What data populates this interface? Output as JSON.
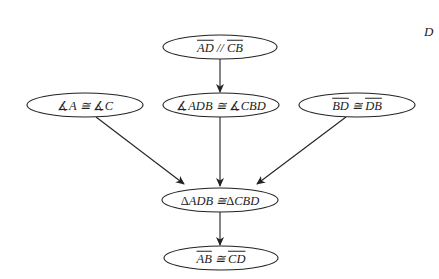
{
  "diagram": {
    "type": "proof-flowchart",
    "colors": {
      "stroke": "#222222",
      "background": "#ffffff",
      "text": "#222222"
    },
    "corner_label": "D",
    "nodes": [
      {
        "id": "given_parallel",
        "parts": [
          {
            "t": "AD",
            "overline": true
          },
          {
            "t": " // "
          },
          {
            "t": "CB",
            "overline": true
          }
        ],
        "text": "AD // CB",
        "cx": 220,
        "cy": 47,
        "rx": 57,
        "ry": 12
      },
      {
        "id": "angles_a_c",
        "parts": [
          {
            "t": "∡",
            "upright": true
          },
          {
            "t": "A ≅ "
          },
          {
            "t": "∡",
            "upright": true
          },
          {
            "t": "C"
          }
        ],
        "text": "∡A ≅ ∡C",
        "cx": 85,
        "cy": 105,
        "rx": 58,
        "ry": 12
      },
      {
        "id": "angles_adb_cbd",
        "parts": [
          {
            "t": "∡",
            "upright": true
          },
          {
            "t": "ADB ≅ "
          },
          {
            "t": "∡",
            "upright": true
          },
          {
            "t": "CBD"
          }
        ],
        "text": "∡ADB ≅ ∡CBD",
        "cx": 221,
        "cy": 105,
        "rx": 58,
        "ry": 12
      },
      {
        "id": "side_bd_db",
        "parts": [
          {
            "t": "BD",
            "overline": true
          },
          {
            "t": " ≅ "
          },
          {
            "t": "DB",
            "overline": true
          }
        ],
        "text": "BD ≅ DB",
        "cx": 357,
        "cy": 105,
        "rx": 58,
        "ry": 12
      },
      {
        "id": "triangles_congruent",
        "parts": [
          {
            "t": "Δ",
            "upright": true
          },
          {
            "t": "ADB ≅"
          },
          {
            "t": "Δ",
            "upright": true
          },
          {
            "t": "CBD"
          }
        ],
        "text": "ΔADB ≅ ΔCBD",
        "cx": 220,
        "cy": 200,
        "rx": 58,
        "ry": 12
      },
      {
        "id": "conclusion",
        "parts": [
          {
            "t": "AB",
            "overline": true
          },
          {
            "t": " ≅ "
          },
          {
            "t": "CD",
            "overline": true
          }
        ],
        "text": "AB ≅ CD",
        "cx": 221,
        "cy": 258,
        "rx": 57,
        "ry": 12
      }
    ],
    "edges": [
      {
        "from": "given_parallel",
        "to": "angles_adb_cbd",
        "x1": 220,
        "y1": 59,
        "x2": 220,
        "y2": 92
      },
      {
        "from": "angles_a_c",
        "to": "triangles_congruent",
        "x1": 96,
        "y1": 117,
        "x2": 184,
        "y2": 184
      },
      {
        "from": "angles_adb_cbd",
        "to": "triangles_congruent",
        "x1": 220,
        "y1": 117,
        "x2": 220,
        "y2": 186
      },
      {
        "from": "side_bd_db",
        "to": "triangles_congruent",
        "x1": 346,
        "y1": 117,
        "x2": 257,
        "y2": 184
      },
      {
        "from": "triangles_congruent",
        "to": "conclusion",
        "x1": 220,
        "y1": 212,
        "x2": 220,
        "y2": 245
      }
    ]
  }
}
